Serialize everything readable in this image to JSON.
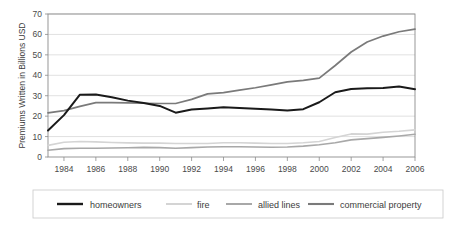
{
  "chart_data": {
    "type": "line",
    "title": "",
    "subtitle": "",
    "xlabel": "",
    "ylabel": "Premiums Written in Billions USD",
    "xlim": [
      1983,
      2006
    ],
    "ylim": [
      0,
      70
    ],
    "yticks": [
      0,
      10,
      20,
      30,
      40,
      50,
      60,
      70
    ],
    "xticks": [
      1984,
      1986,
      1988,
      1990,
      1992,
      1994,
      1996,
      1998,
      2000,
      2002,
      2004,
      2006
    ],
    "xtick_labels": [
      "1984",
      "1986",
      "1988",
      "1990",
      "1992",
      "1994",
      "1996",
      "1998",
      "2000",
      "2002",
      "2004",
      "2006"
    ],
    "ytick_labels": [
      "0",
      "10",
      "20",
      "30",
      "40",
      "50",
      "60",
      "70"
    ],
    "grid": true,
    "grid_axis": "y",
    "legend_position": "bottom",
    "x": [
      1983,
      1984,
      1985,
      1986,
      1987,
      1988,
      1989,
      1990,
      1991,
      1992,
      1993,
      1994,
      1995,
      1996,
      1997,
      1998,
      1999,
      2000,
      2001,
      2002,
      2003,
      2004,
      2005,
      2006
    ],
    "series": [
      {
        "name": "homeowners",
        "color": "#1a1a1a",
        "width": 2.0,
        "values": [
          13.0,
          20.5,
          30.5,
          30.6,
          29.2,
          27.6,
          26.4,
          25.0,
          21.7,
          23.3,
          23.8,
          24.4,
          24.0,
          23.6,
          23.2,
          22.8,
          23.4,
          26.8,
          31.7,
          33.3,
          33.6,
          33.8,
          34.5,
          33.2
        ]
      },
      {
        "name": "fire",
        "color": "#d4d4d4",
        "width": 1.6,
        "values": [
          5.7,
          7.2,
          7.6,
          7.4,
          7.1,
          6.9,
          6.8,
          6.8,
          6.6,
          6.6,
          6.6,
          7.0,
          7.0,
          6.8,
          6.6,
          6.6,
          7.0,
          7.6,
          9.5,
          11.3,
          11.2,
          12.1,
          12.6,
          13.3
        ]
      },
      {
        "name": "allied lines",
        "color": "#a8a8a8",
        "width": 1.6,
        "values": [
          3.3,
          4.1,
          4.3,
          4.3,
          4.4,
          4.5,
          4.7,
          4.6,
          4.3,
          4.6,
          4.9,
          5.0,
          5.0,
          4.9,
          4.8,
          4.9,
          5.3,
          6.0,
          7.0,
          8.4,
          9.0,
          9.6,
          10.3,
          11.1
        ]
      },
      {
        "name": "commercial property",
        "color": "#7a7a7a",
        "width": 1.7,
        "values": [
          21.6,
          22.7,
          24.8,
          26.6,
          26.6,
          26.5,
          26.3,
          26.2,
          26.2,
          28.2,
          30.9,
          31.5,
          32.7,
          33.9,
          35.3,
          36.8,
          37.5,
          38.6,
          44.8,
          51.4,
          56.3,
          59.2,
          61.3,
          62.6
        ]
      }
    ]
  },
  "legend": {
    "entries": [
      {
        "label": "homeowners"
      },
      {
        "label": "fire"
      },
      {
        "label": "allied lines"
      },
      {
        "label": "commercial property"
      }
    ]
  }
}
